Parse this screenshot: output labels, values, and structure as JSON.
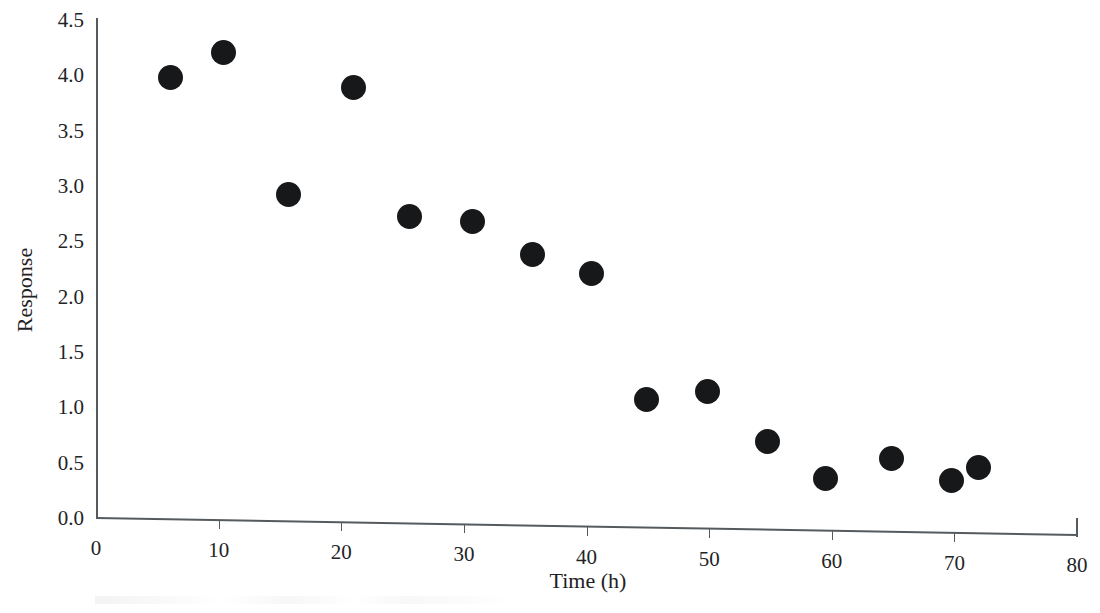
{
  "chart_data": {
    "type": "scatter",
    "title": "",
    "subtitle": "",
    "xlabel": "Time (h)",
    "ylabel": "Response",
    "xlim": [
      0,
      80
    ],
    "ylim": [
      0.0,
      4.5
    ],
    "xticks": [
      0,
      10,
      20,
      30,
      40,
      50,
      60,
      70,
      80
    ],
    "xtick_labels": [
      "0",
      "10",
      "20",
      "30",
      "40",
      "50",
      "60",
      "70",
      "80"
    ],
    "yticks": [
      0.0,
      0.5,
      1.0,
      1.5,
      2.0,
      2.5,
      3.0,
      3.5,
      4.0,
      4.5
    ],
    "ytick_labels": [
      "0.0",
      "0.5",
      "1.0",
      "1.5",
      "2.0",
      "2.5",
      "3.0",
      "3.5",
      "4.0",
      "4.5"
    ],
    "grid": false,
    "legend": null,
    "marker": {
      "shape": "circle",
      "filled": true,
      "color": "#17181a",
      "size_px": 25
    },
    "axis_color": "#555a5e",
    "background_color": "#ffffff",
    "series": [
      {
        "name": "Response vs Time",
        "x": [
          6.1,
          10.4,
          15.7,
          21.0,
          25.6,
          30.7,
          35.6,
          40.4,
          44.9,
          49.9,
          54.8,
          59.5,
          64.9,
          69.8,
          72.0
        ],
        "y": [
          3.98,
          4.21,
          2.92,
          3.89,
          2.72,
          2.68,
          2.38,
          2.21,
          1.07,
          1.14,
          0.69,
          0.36,
          0.54,
          0.34,
          0.46
        ]
      }
    ]
  }
}
